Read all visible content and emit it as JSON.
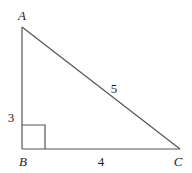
{
  "diagram": {
    "type": "right-triangle",
    "vertices": {
      "A": {
        "label": "A",
        "x": 22,
        "y": 27
      },
      "B": {
        "label": "B",
        "x": 22,
        "y": 149
      },
      "C": {
        "label": "C",
        "x": 180,
        "y": 149
      }
    },
    "sides": {
      "AB": {
        "label": "3"
      },
      "BC": {
        "label": "4"
      },
      "AC": {
        "label": "5"
      }
    },
    "right_angle_at": "B",
    "colors": {
      "line": "#555555",
      "text": "#222222",
      "background": "#ffffff"
    }
  }
}
